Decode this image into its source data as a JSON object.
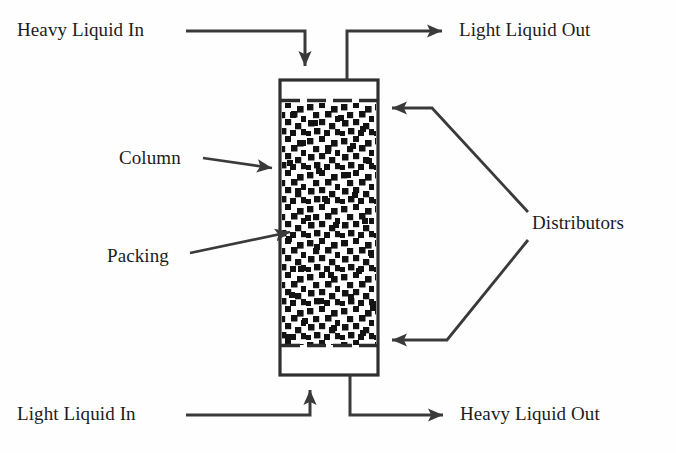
{
  "figure": {
    "type": "process-flow-diagram",
    "background_color": "#fefefe",
    "line_color": "#333333",
    "packing_color": "#111111"
  },
  "labels": {
    "heavy_liquid_in": "Heavy Liquid In",
    "light_liquid_out": "Light Liquid Out",
    "light_liquid_in": "Light Liquid In",
    "heavy_liquid_out": "Heavy Liquid Out",
    "column": "Column",
    "packing": "Packing",
    "distributors": "Distributors"
  },
  "caption": {
    "ghost_text": ""
  },
  "geometry": {
    "column": {
      "x": 280,
      "y": 80,
      "width": 98,
      "height": 295
    },
    "packing": {
      "x": 282,
      "y": 103,
      "width": 94,
      "height": 242
    },
    "top_distributor_y": 100,
    "bottom_distributor_y": 345,
    "heavy_in_pipe_x": 305,
    "light_out_pipe_x": 347,
    "light_in_pipe_x": 310,
    "heavy_out_pipe_x": 350
  },
  "flows": [
    {
      "name": "heavy-liquid-in",
      "direction": "into-top",
      "label": "Heavy Liquid In"
    },
    {
      "name": "light-liquid-out",
      "direction": "out-top",
      "label": "Light Liquid Out"
    },
    {
      "name": "light-liquid-in",
      "direction": "into-bottom",
      "label": "Light Liquid In"
    },
    {
      "name": "heavy-liquid-out",
      "direction": "out-bottom",
      "label": "Heavy Liquid Out"
    }
  ]
}
